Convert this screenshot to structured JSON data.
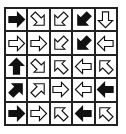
{
  "puzzle": {
    "rows": 5,
    "cols": 5,
    "cells": [
      [
        {
          "dir": "right",
          "fill": "black"
        },
        {
          "dir": "down-right",
          "fill": "white"
        },
        {
          "dir": "down-left",
          "fill": "white"
        },
        {
          "dir": "down-left",
          "fill": "black"
        },
        {
          "dir": "down",
          "fill": "white"
        }
      ],
      [
        {
          "dir": "right",
          "fill": "white"
        },
        {
          "dir": "right",
          "fill": "white"
        },
        {
          "dir": "down-left",
          "fill": "white"
        },
        {
          "dir": "down-left",
          "fill": "black"
        },
        {
          "dir": "left",
          "fill": "white"
        }
      ],
      [
        {
          "dir": "up",
          "fill": "black"
        },
        {
          "dir": "down-right",
          "fill": "white"
        },
        {
          "dir": "up-left",
          "fill": "white"
        },
        {
          "dir": "left",
          "fill": "white"
        },
        {
          "dir": "up-left",
          "fill": "white"
        }
      ],
      [
        {
          "dir": "up-right",
          "fill": "black"
        },
        {
          "dir": "up-right",
          "fill": "white"
        },
        {
          "dir": "right",
          "fill": "white"
        },
        {
          "dir": "left",
          "fill": "white"
        },
        {
          "dir": "left",
          "fill": "black"
        }
      ],
      [
        {
          "dir": "right",
          "fill": "black"
        },
        {
          "dir": "right",
          "fill": "white"
        },
        {
          "dir": "up-left",
          "fill": "white"
        },
        {
          "dir": "left",
          "fill": "black"
        },
        {
          "dir": "up-left",
          "fill": "white"
        }
      ]
    ]
  },
  "colors": {
    "black": "#111111",
    "white": "#ffffff",
    "stroke": "#111111",
    "grid": "#222222"
  }
}
